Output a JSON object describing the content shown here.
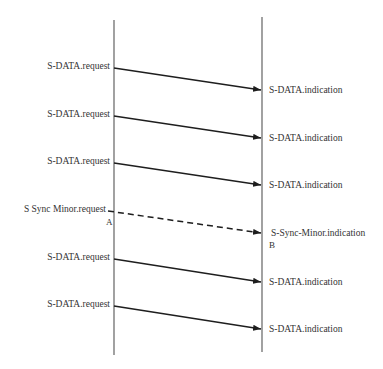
{
  "diagram": {
    "type": "sequence",
    "lifelines": [
      {
        "id": "left",
        "x": 114,
        "y1": 20,
        "y2": 355
      },
      {
        "id": "right",
        "x": 262,
        "y1": 17,
        "y2": 352
      }
    ],
    "messages": [
      {
        "request": "S-DATA.request",
        "indication": "S-DATA.indication",
        "y1": 68,
        "y2": 90,
        "style": "solid"
      },
      {
        "request": "S-DATA.request",
        "indication": "S-DATA.indication",
        "y1": 116,
        "y2": 138,
        "style": "solid"
      },
      {
        "request": "S-DATA.request",
        "indication": "S-DATA.indication",
        "y1": 163,
        "y2": 185,
        "style": "solid"
      },
      {
        "request": "S Sync Minor.request",
        "indication": "S-Sync-Minor.indication",
        "y1": 211,
        "y2": 233,
        "style": "dashed"
      },
      {
        "request": "S-DATA.request",
        "indication": "S-DATA.indication",
        "y1": 259,
        "y2": 282,
        "style": "solid"
      },
      {
        "request": "S-DATA.request",
        "indication": "S-DATA.indication",
        "y1": 306,
        "y2": 329,
        "style": "solid"
      }
    ],
    "markers": {
      "a": "A",
      "b": "B"
    }
  }
}
